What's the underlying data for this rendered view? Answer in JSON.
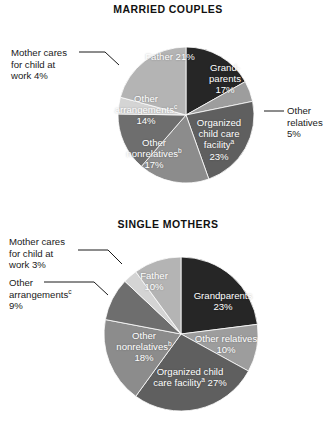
{
  "chart_data": [
    {
      "type": "pie",
      "title": "MARRIED COUPLES",
      "xlabel": "",
      "ylabel": "",
      "legend": "labels-on-slices-and-callouts",
      "start_angle_deg": 0,
      "direction": "clockwise",
      "categories": [
        "Grandparents",
        "Other relatives",
        "Organized child care facility",
        "Other nonrelatives",
        "Other arrangements",
        "Mother cares for child at work",
        "Father"
      ],
      "values": [
        17,
        5,
        23,
        17,
        14,
        4,
        21
      ],
      "slices": [
        {
          "label": "Grand-\nparents",
          "label_line1": "Grand-",
          "label_line2": "parents",
          "value": 17,
          "value_text": "17%",
          "color": "#262626",
          "placement": "inside"
        },
        {
          "label": "Other relatives",
          "value": 5,
          "value_text": "5%",
          "color": "#9d9d9d",
          "placement": "callout-right"
        },
        {
          "label": "Organized child care facility",
          "value": 23,
          "value_text": "23%",
          "color": "#5f5f5f",
          "placement": "inside",
          "footnote": "a"
        },
        {
          "label": "Other nonrelatives",
          "value": 17,
          "value_text": "17%",
          "color": "#8c8c8c",
          "placement": "inside",
          "footnote": "b"
        },
        {
          "label": "Other arrangements",
          "value": 14,
          "value_text": "14%",
          "color": "#6e6e6e",
          "placement": "inside",
          "footnote": "c"
        },
        {
          "label": "Mother cares for child at work",
          "value": 4,
          "value_text": "4%",
          "color": "#d4d4d4",
          "placement": "callout-left"
        },
        {
          "label": "Father",
          "value": 21,
          "value_text": "21%",
          "color": "#b4b4b4",
          "placement": "inside"
        }
      ]
    },
    {
      "type": "pie",
      "title": "SINGLE MOTHERS",
      "xlabel": "",
      "ylabel": "",
      "legend": "labels-on-slices-and-callouts",
      "start_angle_deg": 0,
      "direction": "clockwise",
      "categories": [
        "Grandparents",
        "Other relatives",
        "Organized child care facility",
        "Other nonrelatives",
        "Other arrangements",
        "Mother cares for child at work",
        "Father"
      ],
      "values": [
        23,
        10,
        27,
        18,
        9,
        3,
        10
      ],
      "slices": [
        {
          "label": "Grandparents",
          "value": 23,
          "value_text": "23%",
          "color": "#262626",
          "placement": "inside"
        },
        {
          "label": "Other relatives",
          "value": 10,
          "value_text": "10%",
          "color": "#9d9d9d",
          "placement": "inside"
        },
        {
          "label": "Organized child care facility",
          "value": 27,
          "value_text": "27%",
          "color": "#5f5f5f",
          "placement": "inside",
          "footnote": "a"
        },
        {
          "label": "Other nonrelatives",
          "value": 18,
          "value_text": "18%",
          "color": "#8c8c8c",
          "placement": "inside",
          "footnote": "b"
        },
        {
          "label": "Other arrangements",
          "value": 9,
          "value_text": "9%",
          "color": "#6e6e6e",
          "placement": "callout-left",
          "footnote": "c"
        },
        {
          "label": "Mother cares for child at work",
          "value": 3,
          "value_text": "3%",
          "color": "#d4d4d4",
          "placement": "callout-left"
        },
        {
          "label": "Father",
          "value": 10,
          "value_text": "10%",
          "color": "#b4b4b4",
          "placement": "inside"
        }
      ]
    }
  ],
  "married": {
    "title": "MARRIED COUPLES",
    "callout_mother_l1": "Mother cares",
    "callout_mother_l2": "for child at",
    "callout_mother_l3": "work  4%",
    "callout_other_rel_l1": "Other",
    "callout_other_rel_l2": "relatives",
    "callout_other_rel_l3": "5%",
    "father_label": "Father  21%",
    "grandparents_l1": "Grand-",
    "grandparents_l2": "parents",
    "grandparents_l3": "17%",
    "organized_l1": "Organized",
    "organized_l2": "child care",
    "organized_l3": "facility",
    "organized_fn": "a",
    "organized_l4": "23%",
    "nonrel_l1": "Other",
    "nonrel_l2": "nonrelatives",
    "nonrel_fn": "b",
    "nonrel_l3": "17%",
    "arrange_l1": "Other",
    "arrange_l2": "arrangements",
    "arrange_fn": "c",
    "arrange_l3": "14%"
  },
  "single": {
    "title": "SINGLE MOTHERS",
    "callout_mother_l1": "Mother cares",
    "callout_mother_l2": "for child at",
    "callout_mother_l3": "work  3%",
    "callout_arrange_l1": "Other",
    "callout_arrange_l2": "arrangements",
    "callout_arrange_fn": "c",
    "callout_arrange_l3": "9%",
    "father_l1": "Father",
    "father_l2": "10%",
    "grandparents_l1": "Grandparents",
    "grandparents_l2": "23%",
    "other_rel_l1": "Other relatives",
    "other_rel_l2": "10%",
    "organized_l1": "Organized child",
    "organized_l2": "care facility",
    "organized_fn": "a",
    "organized_l2b": "27%",
    "nonrel_l1": "Other",
    "nonrel_l2": "nonrelatives",
    "nonrel_fn": "b",
    "nonrel_l3": "18%"
  }
}
